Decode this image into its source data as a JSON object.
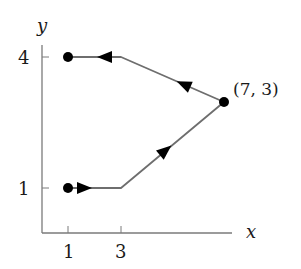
{
  "diagram": {
    "type": "path-diagram",
    "axes": {
      "x_label": "x",
      "y_label": "y",
      "x_ticks": [
        {
          "value": 1,
          "label": "1"
        },
        {
          "value": 3,
          "label": "3"
        }
      ],
      "y_ticks": [
        {
          "value": 1,
          "label": "1"
        },
        {
          "value": 4,
          "label": "4"
        }
      ]
    },
    "points": [
      {
        "x": 1,
        "y": 1,
        "label": ""
      },
      {
        "x": 7,
        "y": 3,
        "label": "(7, 3)"
      },
      {
        "x": 1,
        "y": 4,
        "label": ""
      }
    ],
    "path": {
      "vertices": [
        [
          1,
          1
        ],
        [
          3,
          1
        ],
        [
          7,
          3
        ],
        [
          3,
          4
        ],
        [
          1,
          4
        ]
      ],
      "direction": "from (1,1) right to (3,1), up-right to (7,3), up-left to (3,4), left to (1,4)"
    },
    "colors": {
      "line": "#6e6e6e",
      "marker": "#000000",
      "axis": "#7a7a7a",
      "text": "#1a1a1a"
    }
  }
}
